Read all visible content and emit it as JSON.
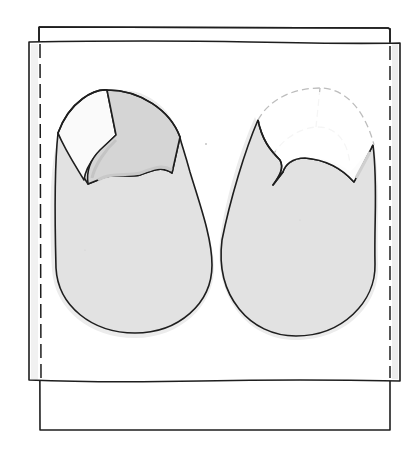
{
  "illustration": {
    "subject": "baby shoe sewing pattern pieces laid on fabric",
    "caption": "Two shoe upper pattern pieces on layered fabric",
    "colors": {
      "background": "#ffffff",
      "ink": "#1e1e1e",
      "fabric_shadow": "#ececec",
      "shoe_fill": "#e2e2e2",
      "shoe_shadow": "#d0d0d0",
      "vamp_fill": "#d5d5d5",
      "toe_fill": "#fafafa",
      "dashed_guide": "#bdbdbd"
    },
    "layers": {
      "back_fabric": {
        "x": 39,
        "y": 27,
        "w": 351,
        "h": 403
      },
      "front_fabric": {
        "x": 29,
        "y": 42,
        "w": 371,
        "h": 339
      },
      "seam_allowance_left_x": 40,
      "seam_allowance_right_x": 390
    },
    "pieces": [
      {
        "name": "left-shoe-piece",
        "toe_cap": "solid outline, shaded vamp"
      },
      {
        "name": "right-shoe-piece",
        "toe_cap": "dashed outline (cut away)"
      }
    ]
  }
}
